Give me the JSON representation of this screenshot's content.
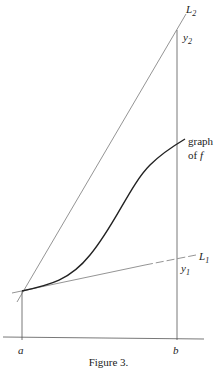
{
  "figure": {
    "caption": "Figure 3.",
    "labels": {
      "L2": {
        "main": "L",
        "sub": "2"
      },
      "y2": {
        "main": "y",
        "sub": "2"
      },
      "graph_line1": "graph",
      "graph_line2_prefix": "of ",
      "graph_line2_var": "f",
      "L1": {
        "main": "L",
        "sub": "1"
      },
      "y1": {
        "main": "y",
        "sub": "1"
      },
      "a": "a",
      "b": "b"
    },
    "colors": {
      "lines": "#555555",
      "curve": "#222222",
      "text": "#222222"
    }
  }
}
